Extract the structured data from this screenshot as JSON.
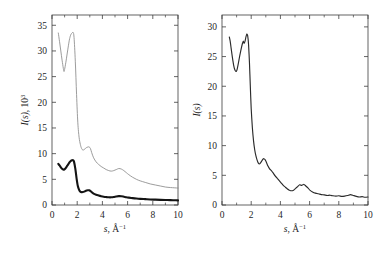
{
  "figure": {
    "background": "#ffffff",
    "panel_count": 2
  },
  "chart_data": [
    {
      "type": "line",
      "panel": "left",
      "title": "",
      "xlabel": "s, Å⁻¹",
      "ylabel": "I(s), 10³",
      "ylabel_parts": {
        "italic": "I(s)",
        "rest": ", 10",
        "sup": "3"
      },
      "xlim": [
        0,
        10
      ],
      "ylim": [
        0,
        37
      ],
      "xticks": [
        0,
        2,
        4,
        6,
        8,
        10
      ],
      "xticklabels": [
        "0",
        "2",
        "4",
        "6",
        "8",
        "10"
      ],
      "xminorticks": [
        1,
        3,
        5,
        7,
        9
      ],
      "yticks": [
        0,
        5,
        10,
        15,
        20,
        25,
        30,
        35
      ],
      "yticklabels": [
        "0",
        "5",
        "10",
        "15",
        "20",
        "25",
        "30",
        "35"
      ],
      "grid": false,
      "legend": "none",
      "colors": {
        "upper": "#8a8a8a",
        "lower": "#141414"
      },
      "series": [
        {
          "name": "upper-thin-curve",
          "style": "thin-gray",
          "color": "#8a8a8a",
          "x": [
            0.5,
            0.6,
            0.7,
            0.8,
            0.9,
            0.95,
            1.0,
            1.1,
            1.2,
            1.3,
            1.4,
            1.5,
            1.6,
            1.68,
            1.75,
            1.85,
            1.95,
            2.05,
            2.15,
            2.25,
            2.35,
            2.45,
            2.55,
            2.65,
            2.75,
            2.85,
            2.95,
            3.05,
            3.15,
            3.3,
            3.5,
            3.7,
            3.9,
            4.1,
            4.3,
            4.5,
            4.7,
            4.9,
            5.1,
            5.3,
            5.5,
            5.7,
            5.9,
            6.1,
            6.4,
            6.7,
            7.0,
            7.4,
            7.8,
            8.2,
            8.6,
            9.0,
            9.4,
            9.7,
            10.0
          ],
          "y": [
            33.5,
            31.8,
            30.0,
            28.2,
            26.6,
            26.0,
            26.4,
            27.8,
            29.4,
            31.0,
            32.4,
            33.2,
            33.5,
            33.6,
            32.6,
            28.0,
            21.5,
            16.0,
            13.2,
            11.8,
            11.0,
            10.7,
            10.8,
            11.0,
            11.2,
            11.3,
            11.3,
            11.0,
            10.2,
            9.2,
            8.4,
            7.9,
            7.5,
            7.2,
            6.9,
            6.7,
            6.6,
            6.7,
            6.9,
            7.1,
            7.0,
            6.7,
            6.3,
            5.9,
            5.4,
            5.0,
            4.7,
            4.4,
            4.1,
            3.9,
            3.7,
            3.5,
            3.4,
            3.35,
            3.3
          ]
        },
        {
          "name": "lower-thick-curve",
          "style": "thick-black",
          "color": "#141414",
          "x": [
            0.5,
            0.6,
            0.7,
            0.8,
            0.9,
            0.95,
            1.0,
            1.1,
            1.2,
            1.3,
            1.4,
            1.5,
            1.6,
            1.68,
            1.75,
            1.85,
            1.95,
            2.05,
            2.15,
            2.25,
            2.35,
            2.45,
            2.55,
            2.65,
            2.75,
            2.85,
            2.95,
            3.05,
            3.15,
            3.3,
            3.5,
            3.7,
            3.9,
            4.1,
            4.3,
            4.5,
            4.7,
            4.9,
            5.1,
            5.3,
            5.5,
            5.7,
            5.9,
            6.1,
            6.4,
            6.7,
            7.0,
            7.4,
            7.8,
            8.2,
            8.6,
            9.0,
            9.4,
            9.7,
            10.0
          ],
          "y": [
            8.0,
            7.7,
            7.35,
            7.05,
            6.9,
            6.88,
            6.95,
            7.25,
            7.6,
            7.95,
            8.35,
            8.6,
            8.7,
            8.72,
            8.4,
            7.1,
            5.2,
            3.7,
            2.95,
            2.6,
            2.5,
            2.52,
            2.6,
            2.72,
            2.82,
            2.88,
            2.85,
            2.72,
            2.5,
            2.22,
            2.0,
            1.85,
            1.72,
            1.62,
            1.55,
            1.5,
            1.5,
            1.56,
            1.66,
            1.72,
            1.7,
            1.62,
            1.52,
            1.44,
            1.34,
            1.26,
            1.2,
            1.14,
            1.08,
            1.04,
            1.0,
            0.97,
            0.94,
            0.92,
            0.9
          ]
        }
      ]
    },
    {
      "type": "line",
      "panel": "right",
      "title": "",
      "xlabel": "s, Å⁻¹",
      "ylabel": "I(s)",
      "ylabel_parts": {
        "italic": "I(s)",
        "rest": "",
        "sup": ""
      },
      "xlim": [
        0,
        10
      ],
      "ylim": [
        0,
        32
      ],
      "xticks": [
        0,
        2,
        4,
        6,
        8,
        10
      ],
      "xticklabels": [
        "0",
        "2",
        "4",
        "6",
        "8",
        "10"
      ],
      "xminorticks": [
        1,
        3,
        5,
        7,
        9
      ],
      "yticks": [
        0,
        5,
        10,
        15,
        20,
        25,
        30
      ],
      "yticklabels": [
        "0",
        "5",
        "10",
        "15",
        "20",
        "25",
        "30"
      ],
      "grid": false,
      "legend": "none",
      "colors": {
        "main": "#2b2b2b"
      },
      "series": [
        {
          "name": "experimental-curve",
          "style": "noisy-dark",
          "color": "#2b2b2b",
          "x": [
            0.5,
            0.56,
            0.62,
            0.68,
            0.74,
            0.8,
            0.86,
            0.92,
            0.98,
            1.04,
            1.1,
            1.16,
            1.22,
            1.28,
            1.34,
            1.4,
            1.46,
            1.52,
            1.58,
            1.64,
            1.7,
            1.76,
            1.82,
            1.88,
            1.94,
            2.0,
            2.08,
            2.16,
            2.24,
            2.32,
            2.4,
            2.48,
            2.56,
            2.64,
            2.72,
            2.8,
            2.88,
            2.96,
            3.04,
            3.14,
            3.26,
            3.38,
            3.5,
            3.64,
            3.78,
            3.92,
            4.06,
            4.2,
            4.34,
            4.48,
            4.62,
            4.76,
            4.9,
            5.04,
            5.18,
            5.32,
            5.46,
            5.6,
            5.74,
            5.88,
            6.02,
            6.2,
            6.4,
            6.6,
            6.8,
            7.0,
            7.2,
            7.4,
            7.6,
            7.8,
            8.0,
            8.2,
            8.4,
            8.6,
            8.8,
            9.0,
            9.2,
            9.4,
            9.6,
            9.8,
            10.0
          ],
          "y": [
            28.3,
            27.6,
            26.5,
            25.4,
            24.4,
            23.5,
            22.9,
            22.6,
            22.5,
            22.9,
            23.6,
            24.4,
            25.2,
            25.9,
            26.6,
            27.2,
            27.6,
            27.2,
            27.6,
            28.3,
            28.8,
            28.5,
            27.0,
            24.0,
            20.0,
            16.2,
            13.0,
            10.8,
            9.3,
            8.3,
            7.6,
            7.1,
            6.9,
            7.1,
            7.4,
            7.7,
            7.8,
            7.6,
            7.2,
            6.6,
            6.1,
            5.8,
            5.4,
            4.9,
            4.5,
            4.1,
            3.7,
            3.3,
            3.0,
            2.7,
            2.5,
            2.4,
            2.5,
            2.8,
            3.1,
            3.4,
            3.3,
            3.5,
            3.2,
            2.9,
            2.5,
            2.2,
            2.0,
            1.9,
            1.75,
            1.7,
            1.6,
            1.65,
            1.55,
            1.5,
            1.55,
            1.45,
            1.5,
            1.6,
            1.75,
            1.6,
            1.45,
            1.35,
            1.4,
            1.3,
            1.35
          ]
        }
      ]
    }
  ]
}
